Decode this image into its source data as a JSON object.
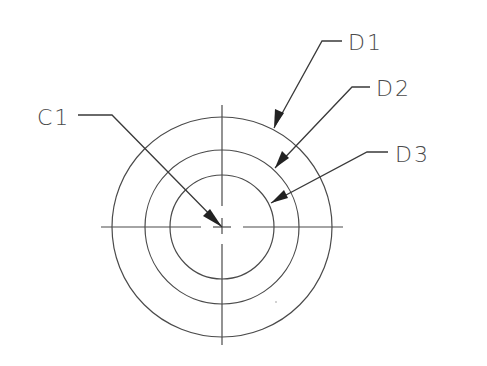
{
  "drawing": {
    "center": {
      "x": 222,
      "y": 227
    },
    "circles": [
      {
        "id": "D1",
        "r": 110
      },
      {
        "id": "D2",
        "r": 77
      },
      {
        "id": "D3",
        "r": 52
      }
    ],
    "line_color": "#4a4a4a"
  },
  "labels": {
    "c1": "C1",
    "d1": "D1",
    "d2": "D2",
    "d3": "D3"
  }
}
